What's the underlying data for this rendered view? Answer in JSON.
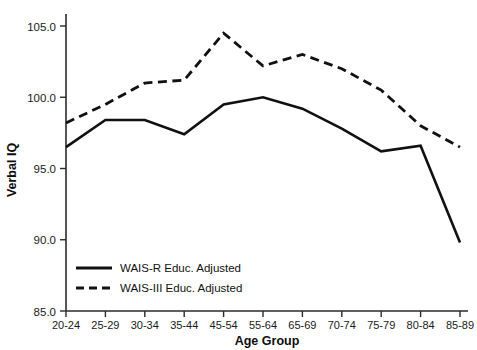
{
  "chart_data": {
    "type": "line",
    "title": "",
    "xlabel": "Age Group",
    "ylabel": "Verbal IQ",
    "categories": [
      "20-24",
      "25-29",
      "30-34",
      "35-44",
      "45-54",
      "55-64",
      "65-69",
      "70-74",
      "75-79",
      "80-84",
      "85-89"
    ],
    "ylim": [
      85.0,
      105.0
    ],
    "yticks": [
      85.0,
      90.0,
      95.0,
      100.0,
      105.0
    ],
    "ytick_labels": [
      "85.0",
      "90.0",
      "95.0",
      "100.0",
      "105.0"
    ],
    "grid": false,
    "legend_position": "lower-left-inside",
    "series": [
      {
        "name": "WAIS-R Educ. Adjusted",
        "style": "solid",
        "color": "#111111",
        "values": [
          96.5,
          98.4,
          98.4,
          97.4,
          99.5,
          100.0,
          99.2,
          97.8,
          96.2,
          96.6,
          89.8
        ]
      },
      {
        "name": "WAIS-III Educ. Adjusted",
        "style": "dashed",
        "color": "#111111",
        "values": [
          98.2,
          99.5,
          101.0,
          101.2,
          104.5,
          102.2,
          103.0,
          102.0,
          100.5,
          98.0,
          96.5
        ]
      }
    ]
  },
  "legend": {
    "items": [
      {
        "label": "WAIS-R Educ. Adjusted"
      },
      {
        "label": "WAIS-III Educ. Adjusted"
      }
    ]
  },
  "axes": {
    "y_title": "Verbal IQ",
    "x_title": "Age Group"
  }
}
